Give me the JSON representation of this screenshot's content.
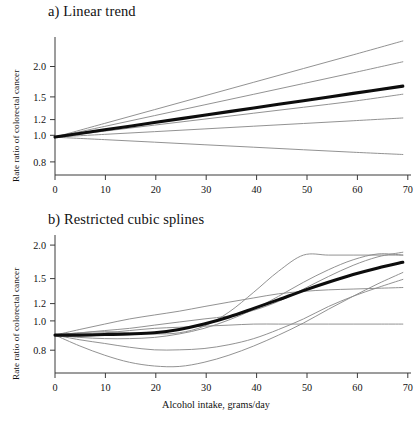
{
  "figure": {
    "xlabel": "Alcohol intake, grams/day",
    "ylabel": "Rate ratio of colorectal cancer"
  },
  "panels": [
    {
      "id": "a",
      "title": "a) Linear trend",
      "ylabel": "Rate ratio of colorectal cancer"
    },
    {
      "id": "b",
      "title": "b) Restricted cubic splines",
      "ylabel": "Rate ratio of colorectal cancer",
      "xlabel": "Alcohol intake, grams/day"
    }
  ],
  "axis": {
    "x_ticks": [
      0,
      10,
      20,
      30,
      40,
      50,
      60,
      70
    ],
    "x_tick_labels": [
      "0",
      "10",
      "20",
      "30",
      "40",
      "50",
      "60",
      "70"
    ],
    "y_ticks": [
      0.8,
      1.0,
      1.2,
      1.5,
      2.0
    ],
    "y_tick_labels": [
      "0.8",
      "1.0",
      "1.2",
      "1.5",
      "2.0"
    ],
    "xlim": [
      0,
      71
    ],
    "ylim": [
      0.72,
      2.38
    ],
    "y_scale": "log",
    "grid": false
  },
  "colors": {
    "thin_line": "#8c8c8c",
    "thick_line": "#0d0d0d",
    "axis": "#3b3b3b",
    "background": "#ffffff",
    "text": "#111111"
  },
  "chart_data": [
    {
      "type": "line",
      "panel": "a",
      "title": "a) Linear trend",
      "xlabel": "",
      "ylabel": "Rate ratio of colorectal cancer",
      "xlim": [
        0,
        71
      ],
      "ylim": [
        0.72,
        2.38
      ],
      "y_scale": "log",
      "grid": false,
      "legend": "none",
      "x": [
        0,
        10,
        20,
        30,
        40,
        50,
        60,
        70
      ],
      "series": [
        {
          "name": "study-1",
          "style": "thin",
          "values": [
            1.0,
            1.126,
            1.268,
            1.428,
            1.608,
            1.811,
            2.039,
            2.3
          ]
        },
        {
          "name": "study-2",
          "style": "thin",
          "values": [
            1.0,
            1.097,
            1.204,
            1.321,
            1.449,
            1.59,
            1.745,
            1.92
          ]
        },
        {
          "name": "study-3",
          "style": "thin",
          "values": [
            1.0,
            1.053,
            1.109,
            1.168,
            1.23,
            1.295,
            1.364,
            1.45
          ]
        },
        {
          "name": "study-4",
          "style": "thin",
          "values": [
            1.0,
            1.024,
            1.048,
            1.073,
            1.099,
            1.125,
            1.152,
            1.18
          ]
        },
        {
          "name": "study-5",
          "style": "thin",
          "values": [
            0.999,
            0.978,
            0.957,
            0.936,
            0.916,
            0.896,
            0.877,
            0.86
          ]
        },
        {
          "name": "pooled-linear-trend",
          "style": "thick",
          "values": [
            1.0,
            1.065,
            1.134,
            1.208,
            1.287,
            1.371,
            1.46,
            1.555
          ]
        }
      ],
      "annotations": []
    },
    {
      "type": "line",
      "panel": "b",
      "title": "b) Restricted cubic splines",
      "xlabel": "Alcohol intake, grams/day",
      "ylabel": "Rate ratio of colorectal cancer",
      "xlim": [
        0,
        71
      ],
      "ylim": [
        0.72,
        2.38
      ],
      "y_scale": "log",
      "grid": false,
      "legend": "none",
      "x": [
        0,
        5,
        10,
        15,
        20,
        25,
        30,
        35,
        40,
        45,
        50,
        55,
        60,
        65,
        70
      ],
      "series": [
        {
          "name": "spline-1",
          "style": "thin",
          "values": [
            1.0,
            1.02,
            1.03,
            1.02,
            1.01,
            1.02,
            1.08,
            1.22,
            1.45,
            1.74,
            2.0,
            2.0,
            2.0,
            2.0,
            2.0
          ]
        },
        {
          "name": "spline-2",
          "style": "thin",
          "values": [
            1.0,
            1.05,
            1.1,
            1.15,
            1.19,
            1.23,
            1.28,
            1.33,
            1.38,
            1.43,
            1.46,
            1.48,
            1.49,
            1.5,
            1.51
          ]
        },
        {
          "name": "spline-3",
          "style": "thin",
          "values": [
            1.0,
            1.02,
            1.04,
            1.06,
            1.09,
            1.12,
            1.15,
            1.18,
            1.24,
            1.34,
            1.49,
            1.66,
            1.83,
            1.97,
            2.05
          ]
        },
        {
          "name": "spline-4",
          "style": "thin",
          "values": [
            1.0,
            1.01,
            1.02,
            1.04,
            1.06,
            1.07,
            1.08,
            1.09,
            1.1,
            1.1,
            1.1,
            1.1,
            1.1,
            1.1,
            1.1
          ]
        },
        {
          "name": "spline-5",
          "style": "thin",
          "values": [
            1.0,
            0.96,
            0.93,
            0.9,
            0.88,
            0.88,
            0.89,
            0.92,
            0.97,
            1.05,
            1.15,
            1.28,
            1.4,
            1.51,
            1.62
          ]
        },
        {
          "name": "spline-6",
          "style": "thin",
          "values": [
            1.0,
            0.91,
            0.84,
            0.79,
            0.765,
            0.762,
            0.79,
            0.84,
            0.91,
            1.0,
            1.11,
            1.25,
            1.4,
            1.56,
            1.72
          ]
        },
        {
          "name": "spline-7",
          "style": "thin",
          "values": [
            1.0,
            0.98,
            0.97,
            0.97,
            0.98,
            1.01,
            1.06,
            1.14,
            1.25,
            1.4,
            1.58,
            1.76,
            1.92,
            2.02,
            2.0
          ]
        },
        {
          "name": "pooled-spline",
          "style": "thick",
          "values": [
            1.0,
            1.0,
            1.005,
            1.01,
            1.02,
            1.05,
            1.1,
            1.17,
            1.26,
            1.36,
            1.47,
            1.58,
            1.69,
            1.79,
            1.88
          ]
        }
      ],
      "annotations": []
    }
  ]
}
